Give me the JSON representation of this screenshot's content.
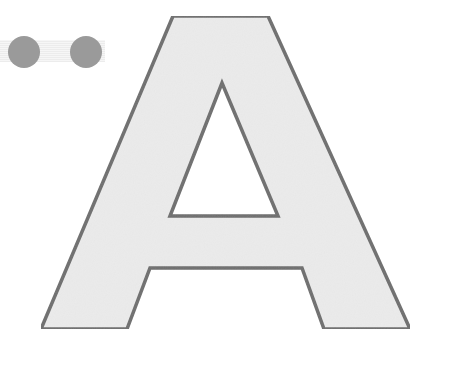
{
  "figure": {
    "letter": "A",
    "colors": {
      "fill": "#ebebeb",
      "stroke": "#6e6e6e",
      "counter": "#ffffff",
      "dots": "#9a9a9a"
    },
    "decorations": {
      "dot_count": 2
    }
  }
}
